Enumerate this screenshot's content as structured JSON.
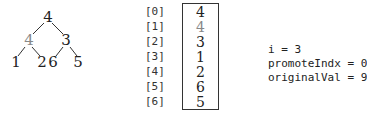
{
  "tree": {
    "nodes": [
      {
        "label": "4",
        "x": 48,
        "y": 22,
        "color": "#222"
      },
      {
        "label": "4",
        "x": 29,
        "y": 45,
        "color": "#888"
      },
      {
        "label": "3",
        "x": 66,
        "y": 45,
        "color": "#222"
      },
      {
        "label": "1",
        "x": 16,
        "y": 67,
        "color": "#222"
      },
      {
        "label": "2",
        "x": 42,
        "y": 67,
        "color": "#222"
      },
      {
        "label": "6",
        "x": 53,
        "y": 67,
        "color": "#222"
      },
      {
        "label": "5",
        "x": 78,
        "y": 67,
        "color": "#222"
      }
    ]
  },
  "array": {
    "indices": [
      "[0]",
      "[1]",
      "[2]",
      "[3]",
      "[4]",
      "[5]",
      "[6]"
    ],
    "values": [
      "4",
      "4",
      "3",
      "1",
      "2",
      "6",
      "5"
    ]
  },
  "variables": [
    "i = 3",
    "promoteIndx = 0",
    "originalVal = 9"
  ]
}
